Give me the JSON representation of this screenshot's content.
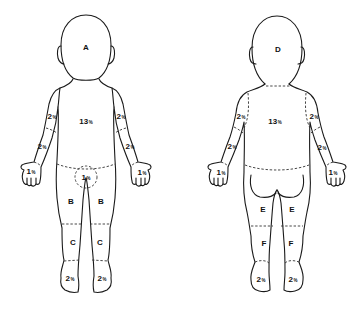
{
  "figures": {
    "front": {
      "view": "anterior",
      "head_label": "A",
      "trunk": {
        "value": "13",
        "unit": "%"
      },
      "upper_arm_left": {
        "value": "2",
        "unit": "%"
      },
      "upper_arm_right": {
        "value": "2",
        "unit": "%"
      },
      "forearm_left": {
        "value": "2",
        "unit": "%"
      },
      "forearm_right": {
        "value": "2",
        "unit": "%"
      },
      "hand_left": {
        "value": "1",
        "unit": "%"
      },
      "hand_right": {
        "value": "1",
        "unit": "%"
      },
      "genitalia": {
        "value": "1",
        "unit": "%"
      },
      "thigh_label": "B",
      "lower_leg_label": "C",
      "foot_left": {
        "value": "2",
        "unit": "%"
      },
      "foot_right": {
        "value": "2",
        "unit": "%"
      }
    },
    "back": {
      "view": "posterior",
      "head_label": "D",
      "trunk": {
        "value": "13",
        "unit": "%"
      },
      "upper_arm_left": {
        "value": "2",
        "unit": "%"
      },
      "upper_arm_right": {
        "value": "2",
        "unit": "%"
      },
      "forearm_left": {
        "value": "2",
        "unit": "%"
      },
      "forearm_right": {
        "value": "2",
        "unit": "%"
      },
      "hand_left": {
        "value": "1",
        "unit": "%"
      },
      "hand_right": {
        "value": "1",
        "unit": "%"
      },
      "thigh_label": "E",
      "lower_leg_label": "F",
      "foot_left": {
        "value": "2",
        "unit": "%"
      },
      "foot_right": {
        "value": "2",
        "unit": "%"
      }
    }
  },
  "colors": {
    "line": "#1a1a1a",
    "background": "#ffffff"
  }
}
